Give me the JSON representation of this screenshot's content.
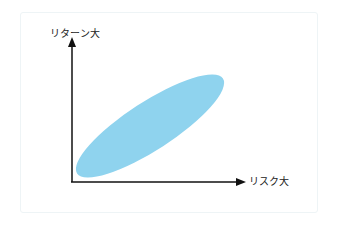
{
  "diagram": {
    "y_axis_label": "リターン大",
    "x_axis_label": "リスク大",
    "colors": {
      "ellipse_fill": "#8fd3ee",
      "axis": "#111111",
      "frame_border": "#eef4f6"
    },
    "shapes": [
      {
        "type": "ellipse",
        "description": "risk-return distribution region",
        "cx": 150,
        "cy": 126,
        "rx": 87,
        "ry": 24,
        "rotation_deg": -33
      }
    ]
  }
}
